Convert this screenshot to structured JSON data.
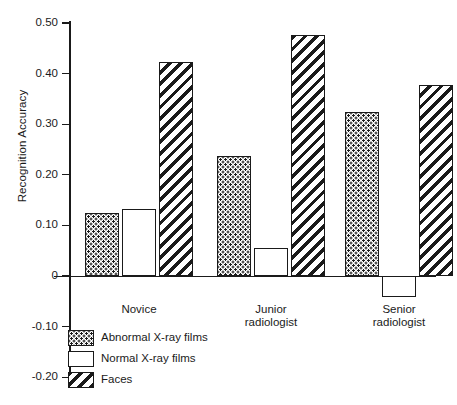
{
  "chart_data": {
    "type": "bar",
    "title": "",
    "xlabel": "",
    "ylabel": "Recognition Accuracy",
    "categories": [
      "Novice",
      "Junior radiologist",
      "Senior radiologist"
    ],
    "series": [
      {
        "name": "Abnormal X-ray films",
        "pattern": "dots",
        "values": [
          0.125,
          0.238,
          0.325
        ]
      },
      {
        "name": "Normal X-ray films",
        "pattern": "white",
        "values": [
          0.133,
          0.056,
          -0.042
        ]
      },
      {
        "name": "Faces",
        "pattern": "hatch",
        "values": [
          0.423,
          0.477,
          0.377
        ]
      }
    ],
    "ylim": [
      -0.2,
      0.5
    ],
    "yticks": [
      0.5,
      0.4,
      0.3,
      0.2,
      0.1,
      0,
      -0.1,
      -0.2
    ],
    "ytick_labels": [
      "0.50",
      "0.40",
      "0.30",
      "0.20",
      "0.10",
      "0",
      "-0.10",
      "-0.20"
    ],
    "grid": false,
    "legend_position": "bottom-left",
    "zero_line": true
  },
  "axis": {
    "y_title": "Recognition Accuracy",
    "ticks": [
      {
        "label": "0.50",
        "value": 0.5
      },
      {
        "label": "0.40",
        "value": 0.4
      },
      {
        "label": "0.30",
        "value": 0.3
      },
      {
        "label": "0.20",
        "value": 0.2
      },
      {
        "label": "0.10",
        "value": 0.1
      },
      {
        "label": "0",
        "value": 0
      },
      {
        "label": "-0.10",
        "value": -0.1
      },
      {
        "label": "-0.20",
        "value": -0.2
      }
    ]
  },
  "groups": [
    {
      "label": "Novice"
    },
    {
      "label": "Junior\nradiologist"
    },
    {
      "label": "Senior\nradiologist"
    }
  ],
  "legend": {
    "items": [
      {
        "label": "Abnormal X-ray films",
        "pattern": "dots"
      },
      {
        "label": "Normal X-ray films",
        "pattern": "white"
      },
      {
        "label": "Faces",
        "pattern": "hatch"
      }
    ]
  },
  "colors": {
    "ink": "#1a1a1a",
    "background": "#ffffff"
  }
}
